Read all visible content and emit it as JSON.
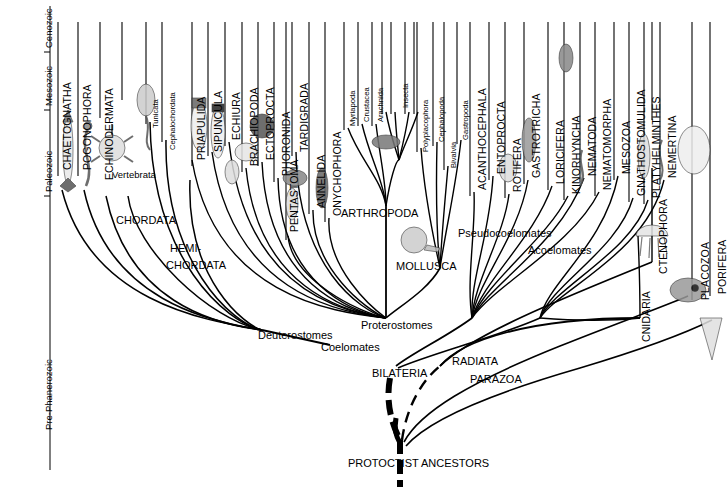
{
  "figure": {
    "background_color": "#ffffff",
    "line_color": "#000000",
    "width": 728,
    "height": 503
  },
  "time_axis": {
    "name": "geological-time-axis",
    "eras": [
      {
        "label": "Cenozoic",
        "y_top": 0,
        "y_bottom": 52
      },
      {
        "label": "Mesozoic",
        "y_top": 52,
        "y_bottom": 110
      },
      {
        "label": "Paleozoic",
        "y_top": 110,
        "y_bottom": 196
      },
      {
        "label": "Pre-Phanerozoic",
        "y_top": 196,
        "y_bottom": 470
      }
    ]
  },
  "phyla": [
    {
      "label": "CHAETOGNATHA",
      "x": 62,
      "y": 170,
      "size": "major"
    },
    {
      "label": "POGONOPHORA",
      "x": 82,
      "y": 170,
      "size": "major"
    },
    {
      "label": "ECHINODERMATA",
      "x": 104,
      "y": 180,
      "size": "major"
    },
    {
      "label": "Tunicata",
      "x": 154,
      "y": 128,
      "size": "minor"
    },
    {
      "label": "Cephalochordata",
      "x": 172,
      "y": 146,
      "size": "minor"
    },
    {
      "label": "Vertebrata",
      "x": 112,
      "y": 158,
      "size": "horiz-minor"
    },
    {
      "label": "PRIAPULIDA",
      "x": 196,
      "y": 160,
      "size": "major"
    },
    {
      "label": "SIPUNCULA",
      "x": 216,
      "y": 152,
      "size": "major"
    },
    {
      "label": "ECHIURA",
      "x": 233,
      "y": 140,
      "size": "major"
    },
    {
      "label": "BRACHIOPODA",
      "x": 250,
      "y": 166,
      "size": "major"
    },
    {
      "label": "ECTOPROCTA",
      "x": 266,
      "y": 160,
      "size": "major"
    },
    {
      "label": "PHORONIDA",
      "x": 282,
      "y": 176,
      "size": "major"
    },
    {
      "label": "PENTASTOMA",
      "x": 290,
      "y": 232,
      "size": "major"
    },
    {
      "label": "TARDIGRADA",
      "x": 300,
      "y": 152,
      "size": "major"
    },
    {
      "label": "ANNELIDA",
      "x": 317,
      "y": 208,
      "size": "major"
    },
    {
      "label": "ONYCHOPHORA",
      "x": 333,
      "y": 216,
      "size": "major"
    },
    {
      "label": "Myriapoda",
      "x": 352,
      "y": 126,
      "size": "minor"
    },
    {
      "label": "Crustacea",
      "x": 366,
      "y": 122,
      "size": "minor"
    },
    {
      "label": "Arachnida",
      "x": 380,
      "y": 122,
      "size": "minor"
    },
    {
      "label": "Insecta",
      "x": 403,
      "y": 112,
      "size": "minor"
    },
    {
      "label": "Polyplacophora",
      "x": 425,
      "y": 146,
      "size": "minor"
    },
    {
      "label": "Cephalopoda",
      "x": 441,
      "y": 140,
      "size": "minor"
    },
    {
      "label": "Bivalvia",
      "x": 452,
      "y": 164,
      "size": "minor"
    },
    {
      "label": "Gastropoda",
      "x": 465,
      "y": 138,
      "size": "minor"
    },
    {
      "label": "ACANTHOCEPHALA",
      "x": 478,
      "y": 190,
      "size": "major"
    },
    {
      "label": "ENTOPROCTA",
      "x": 497,
      "y": 174,
      "size": "major"
    },
    {
      "label": "ROTIFERA",
      "x": 513,
      "y": 192,
      "size": "major"
    },
    {
      "label": "GASTROTRICHA",
      "x": 532,
      "y": 178,
      "size": "major"
    },
    {
      "label": "LORICIFERA",
      "x": 556,
      "y": 184,
      "size": "major"
    },
    {
      "label": "KINORHYNCHA",
      "x": 572,
      "y": 194,
      "size": "major"
    },
    {
      "label": "NEMATODA",
      "x": 588,
      "y": 176,
      "size": "major"
    },
    {
      "label": "NEMATOMORPHA",
      "x": 603,
      "y": 190,
      "size": "major"
    },
    {
      "label": "MESOZOA",
      "x": 622,
      "y": 174,
      "size": "major"
    },
    {
      "label": "GNATHOSTOMULIDA",
      "x": 637,
      "y": 196,
      "size": "major"
    },
    {
      "label": "PLATYHELMINTHES",
      "x": 652,
      "y": 198,
      "size": "major"
    },
    {
      "label": "NEMERTINA",
      "x": 668,
      "y": 178,
      "size": "major"
    },
    {
      "label": "CTENOPHORA",
      "x": 658,
      "y": 274,
      "size": "major"
    },
    {
      "label": "CNIDARIA",
      "x": 642,
      "y": 342,
      "size": "major"
    },
    {
      "label": "PLACOZOA",
      "x": 700,
      "y": 300,
      "size": "major"
    },
    {
      "label": "PORIFERA",
      "x": 718,
      "y": 294,
      "size": "major"
    }
  ],
  "clades": [
    {
      "label": "CHORDATA",
      "x": 116,
      "y": 215,
      "style": "caps"
    },
    {
      "label": "HEMI-",
      "x": 170,
      "y": 243,
      "style": "caps"
    },
    {
      "label": "CHORDATA",
      "x": 166,
      "y": 260,
      "style": "caps"
    },
    {
      "label": "ARTHROPODA",
      "x": 341,
      "y": 208,
      "style": "caps"
    },
    {
      "label": "MOLLUSCA",
      "x": 396,
      "y": 261,
      "style": "caps"
    },
    {
      "label": "Deuterostomes",
      "x": 258,
      "y": 336,
      "style": "mixed"
    },
    {
      "label": "Coelomates",
      "x": 321,
      "y": 348,
      "style": "mixed"
    },
    {
      "label": "Proterostomes",
      "x": 361,
      "y": 326,
      "style": "mixed"
    },
    {
      "label": "Pseudocoelomates",
      "x": 458,
      "y": 234,
      "style": "mixed"
    },
    {
      "label": "Acoelomates",
      "x": 528,
      "y": 251,
      "style": "mixed"
    },
    {
      "label": "BILATERIA",
      "x": 375,
      "y": 375,
      "style": "caps"
    },
    {
      "label": "RADIATA",
      "x": 452,
      "y": 363,
      "style": "caps"
    },
    {
      "label": "PARAZOA",
      "x": 470,
      "y": 381,
      "style": "caps"
    },
    {
      "label": "PROTOCTIST ANCESTORS",
      "x": 348,
      "y": 466,
      "style": "caps"
    }
  ]
}
